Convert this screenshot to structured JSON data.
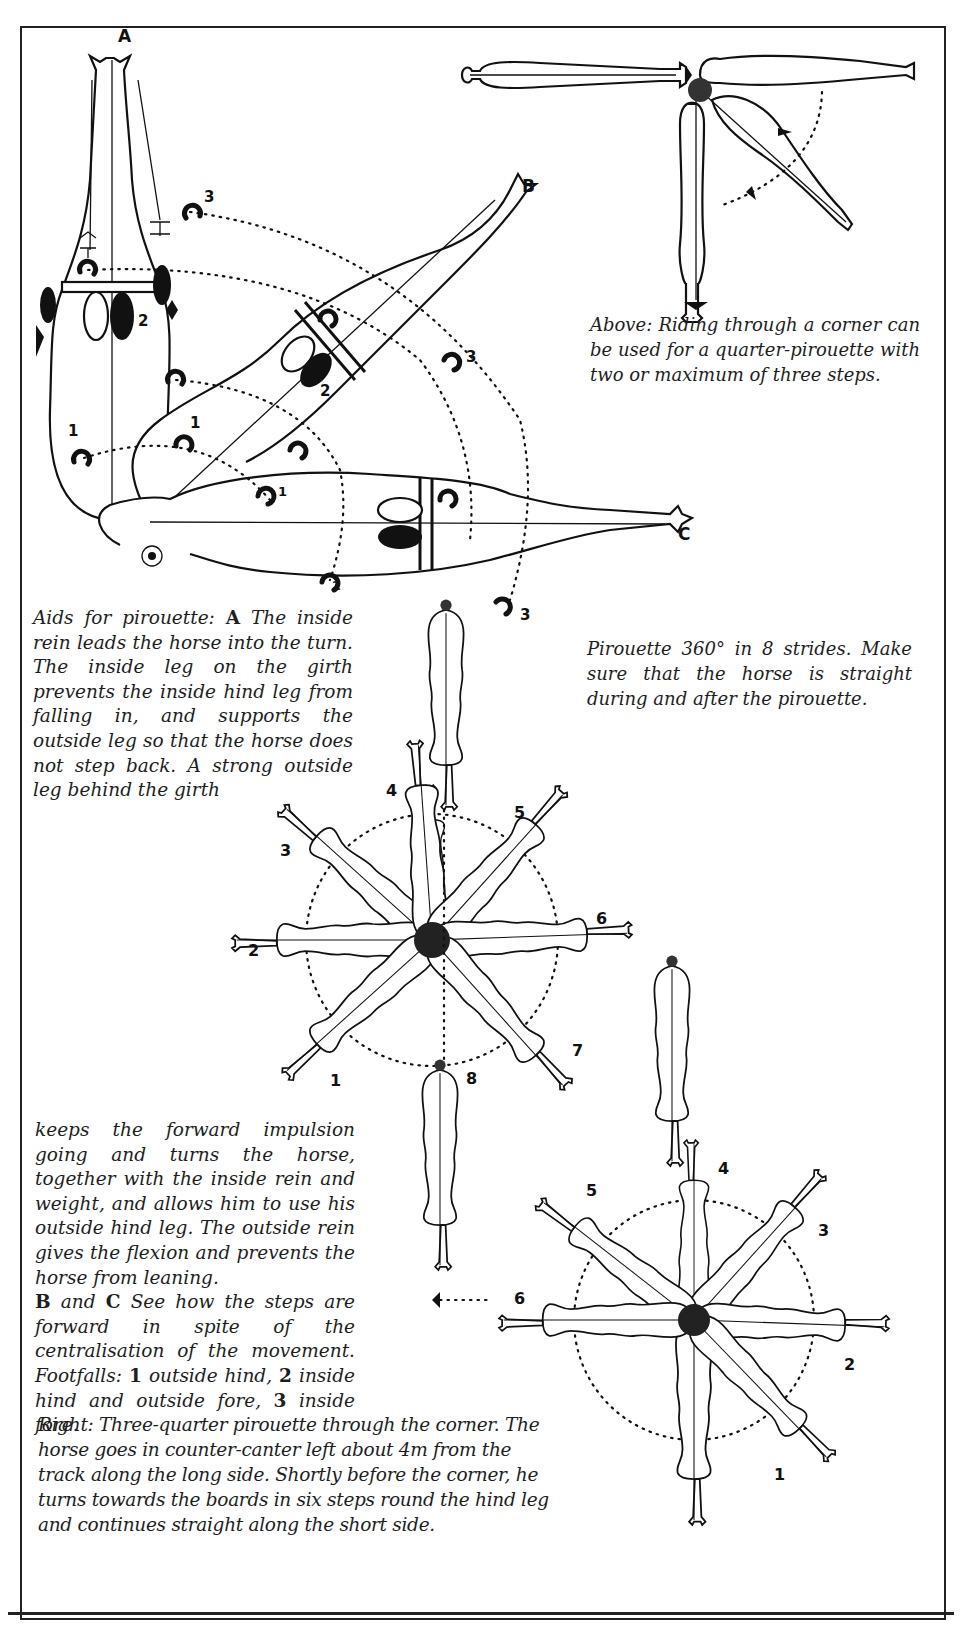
{
  "figure_labels": {
    "A": "A",
    "B": "B",
    "C": "C"
  },
  "footfall_labels": {
    "aids_diagram": [
      "3",
      "2",
      "1",
      "1",
      "2",
      "3",
      "1",
      "2",
      "3"
    ],
    "pirouette_360": [
      "1",
      "2",
      "3",
      "4",
      "5",
      "6",
      "7",
      "8"
    ],
    "three_quarter": [
      "1",
      "2",
      "3",
      "4",
      "5",
      "6"
    ]
  },
  "captions": {
    "above": "Above: Riding through a corner can be used for a quarter-pirouette with two or maximum of three steps.",
    "aids_intro": "Aids for pirouette:",
    "aids_A": "A",
    "aids_text": "The inside rein leads the horse into the turn. The inside leg on the girth prevents the inside hind leg from falling in, and supports the outside leg so that the horse does not step back. A strong outside leg behind the girth",
    "pirouette_360": "Pirouette 360° in 8 strides. Make sure that the horse is straight during and after the pirouette.",
    "continued": "keeps the forward impulsion going and turns the horse, together with the inside rein and weight, and allows him to use his outside hind leg. The outside rein gives the flexion and prevents the horse from leaning.",
    "bc_B": "B",
    "bc_and": "and",
    "bc_C": "C",
    "bc_text": "See how the steps are forward in spite of the centralisation of the movement. Footfalls:",
    "fn_1": "1",
    "fn_1_text": "outside hind,",
    "fn_2": "2",
    "fn_2_text": "inside hind and outside fore,",
    "fn_3": "3",
    "fn_3_text": "inside fore.",
    "right": "Right: Three-quarter pirouette through the corner. The horse goes in counter-canter left about 4m from the track along the long side. Shortly before the corner, he turns towards the boards in six steps round the hind leg and continues straight along the short side."
  },
  "colors": {
    "ink": "#111111",
    "paper": "#ffffff"
  }
}
